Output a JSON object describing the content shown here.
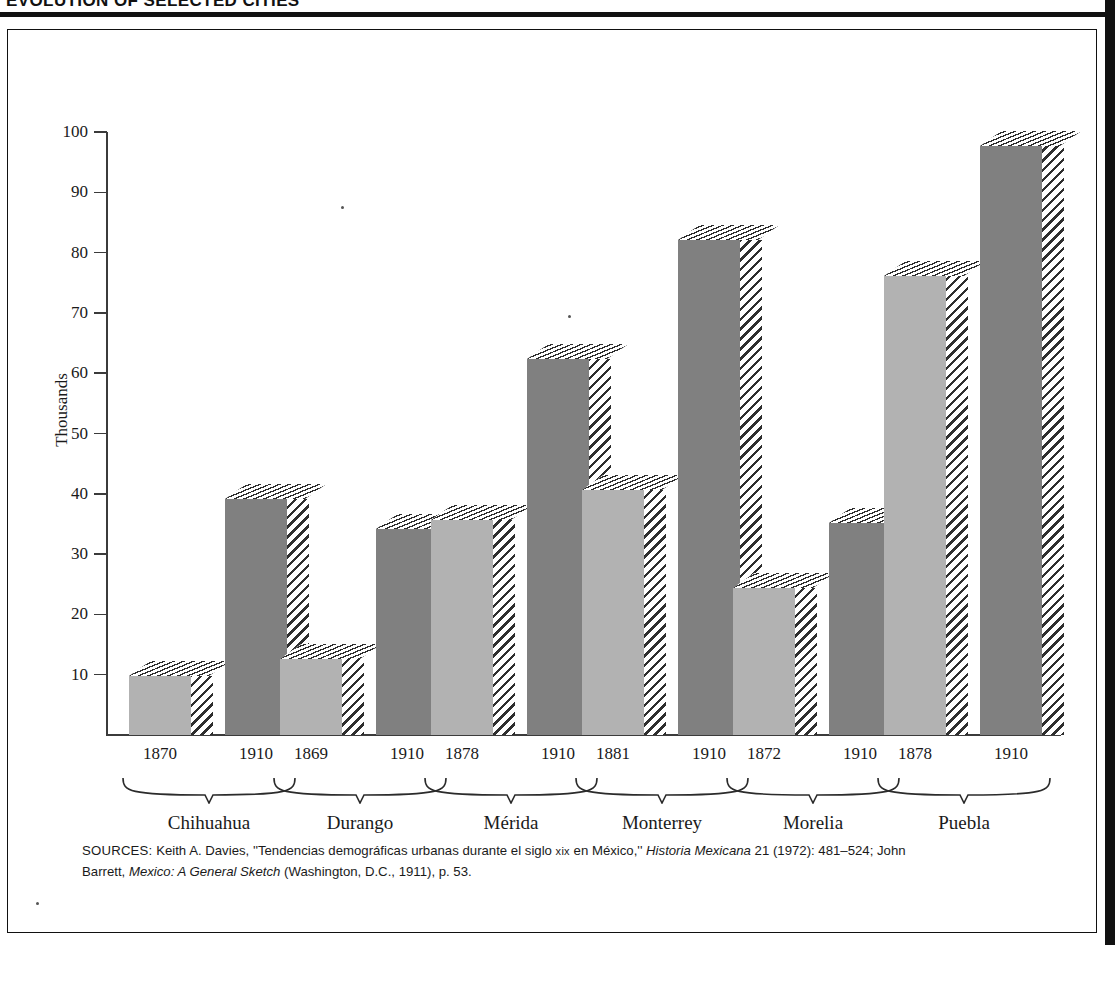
{
  "running_head": "EVOLUTION OF SELECTED CITIES",
  "chart_data": {
    "type": "bar",
    "title": "",
    "xlabel": "",
    "ylabel": "Thousands",
    "ylim": [
      0,
      100
    ],
    "yticks": [
      10,
      20,
      30,
      40,
      50,
      60,
      70,
      80,
      90,
      100
    ],
    "ytick_labels": [
      "10",
      "20",
      "30",
      "40",
      "50",
      "60",
      "70",
      "80",
      "90",
      "100"
    ],
    "grid": false,
    "legend": "none",
    "units": "thousands of inhabitants",
    "groups": [
      {
        "name": "Chihuahua",
        "bars": [
          {
            "year": "1870",
            "value": 9.8,
            "shade": "light"
          },
          {
            "year": "1910",
            "value": 39.1,
            "shade": "dark"
          }
        ]
      },
      {
        "name": "Durango",
        "bars": [
          {
            "year": "1869",
            "value": 12.6,
            "shade": "light"
          },
          {
            "year": "1910",
            "value": 34.1,
            "shade": "dark"
          }
        ]
      },
      {
        "name": "Mérida",
        "bars": [
          {
            "year": "1878",
            "value": 35.6,
            "shade": "light"
          },
          {
            "year": "1910",
            "value": 62.4,
            "shade": "dark"
          }
        ]
      },
      {
        "name": "Monterrey",
        "bars": [
          {
            "year": "1881",
            "value": 40.6,
            "shade": "light"
          },
          {
            "year": "1910",
            "value": 82.1,
            "shade": "dark"
          }
        ]
      },
      {
        "name": "Morelia",
        "bars": [
          {
            "year": "1872",
            "value": 24.4,
            "shade": "light"
          },
          {
            "year": "1910",
            "value": 35.2,
            "shade": "dark"
          }
        ]
      },
      {
        "name": "Puebla",
        "bars": [
          {
            "year": "1878",
            "value": 76.2,
            "shade": "light"
          },
          {
            "year": "1910",
            "value": 97.6,
            "shade": "dark"
          }
        ]
      }
    ],
    "colors": {
      "light_bar": "#b2b2b2",
      "dark_bar": "#808080",
      "hatch": "#2e2e2e",
      "axis": "#3b3b3b",
      "text": "#1a1a1a",
      "background": "#ffffff"
    }
  },
  "sources": {
    "label": "SOURCES:",
    "line1_a": " Keith A. Davies, ''Tendencias demográficas urbanas durante el siglo ",
    "line1_xix": "xix",
    "line1_b": " en México,'' ",
    "line1_italic": "Historia",
    "line2_italic_a": "Mexicana",
    "line2_a": " 21 (1972): 481–524; John Barrett, ",
    "line2_italic_b": "Mexico: A General Sketch",
    "line2_b": " (Washington, D.C., 1911), p. 53."
  }
}
